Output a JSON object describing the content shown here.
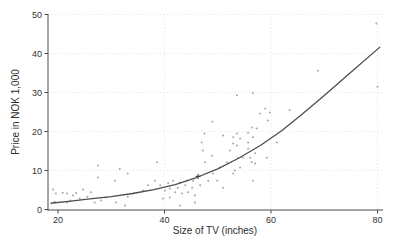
{
  "chart_data": {
    "type": "scatter",
    "title": "",
    "xlabel": "Size of TV (inches)",
    "ylabel": "Price in NOK 1,000",
    "xlim": [
      18,
      81
    ],
    "ylim": [
      0,
      50
    ],
    "x_ticks": [
      20,
      40,
      60,
      80
    ],
    "x_grid_ticks": [
      40,
      60,
      80
    ],
    "y_ticks": [
      0,
      10,
      20,
      30,
      40,
      50
    ],
    "grid": "dotted",
    "legend": "none",
    "colors": {
      "scatter": "#a6a6a6",
      "line": "#4d4d4d",
      "axis": "#4a4a4a",
      "grid": "#dcdcdc",
      "mean_marker": "#333333",
      "text": "#333333"
    },
    "points": [
      [
        19.1,
        5.1
      ],
      [
        19.4,
        2.0
      ],
      [
        19.6,
        4.1
      ],
      [
        20.9,
        4.3
      ],
      [
        21.7,
        4.1
      ],
      [
        21.7,
        1.8
      ],
      [
        22.3,
        2.3
      ],
      [
        22.8,
        3.6
      ],
      [
        23.4,
        4.2
      ],
      [
        24.1,
        2.8
      ],
      [
        24.7,
        5.1
      ],
      [
        25.5,
        3.3
      ],
      [
        26.2,
        4.4
      ],
      [
        26.9,
        1.8
      ],
      [
        27.5,
        8.2
      ],
      [
        27.5,
        11.3
      ],
      [
        28.1,
        2.3
      ],
      [
        29.0,
        3.1
      ],
      [
        30.7,
        7.4
      ],
      [
        30.9,
        1.8
      ],
      [
        31.6,
        10.4
      ],
      [
        32.6,
        1.0
      ],
      [
        33.1,
        3.3
      ],
      [
        33.1,
        9.2
      ],
      [
        34.1,
        4.1
      ],
      [
        36.0,
        4.9
      ],
      [
        36.9,
        6.2
      ],
      [
        38.2,
        7.4
      ],
      [
        38.6,
        12.1
      ],
      [
        39.2,
        6.2
      ],
      [
        39.7,
        2.8
      ],
      [
        40.1,
        4.9
      ],
      [
        40.7,
        6.7
      ],
      [
        41.0,
        3.1
      ],
      [
        41.0,
        5.4
      ],
      [
        41.6,
        7.4
      ],
      [
        42.0,
        4.4
      ],
      [
        42.5,
        5.6
      ],
      [
        42.9,
        1.0
      ],
      [
        42.9,
        6.9
      ],
      [
        43.3,
        4.1
      ],
      [
        43.9,
        6.2
      ],
      [
        44.2,
        7.4
      ],
      [
        44.4,
        4.4
      ],
      [
        45.2,
        5.6
      ],
      [
        45.4,
        7.4
      ],
      [
        45.7,
        1.8
      ],
      [
        45.7,
        3.6
      ],
      [
        46.7,
        6.2
      ],
      [
        47.0,
        17.2
      ],
      [
        47.2,
        15.1
      ],
      [
        47.5,
        19.5
      ],
      [
        47.6,
        12.1
      ],
      [
        48.2,
        7.4
      ],
      [
        48.9,
        13.8
      ],
      [
        49.0,
        22.5
      ],
      [
        49.1,
        9.2
      ],
      [
        49.9,
        7.4
      ],
      [
        50.4,
        10.8
      ],
      [
        51.0,
        5.6
      ],
      [
        51.0,
        19.0
      ],
      [
        51.7,
        12.1
      ],
      [
        52.3,
        15.1
      ],
      [
        52.9,
        9.2
      ],
      [
        52.9,
        16.9
      ],
      [
        52.9,
        18.5
      ],
      [
        53.2,
        10.0
      ],
      [
        53.6,
        16.4
      ],
      [
        53.6,
        19.5
      ],
      [
        53.6,
        29.3
      ],
      [
        53.8,
        13.3
      ],
      [
        54.2,
        10.8
      ],
      [
        54.2,
        18.2
      ],
      [
        54.7,
        13.3
      ],
      [
        55.7,
        15.6
      ],
      [
        55.7,
        17.2
      ],
      [
        55.7,
        19.7
      ],
      [
        56.1,
        13.3
      ],
      [
        56.4,
        12.1
      ],
      [
        56.4,
        21.0
      ],
      [
        56.6,
        7.4
      ],
      [
        56.6,
        18.5
      ],
      [
        56.6,
        29.9
      ],
      [
        57.0,
        11.8
      ],
      [
        57.0,
        14.4
      ],
      [
        57.3,
        20.8
      ],
      [
        57.9,
        24.6
      ],
      [
        58.9,
        25.9
      ],
      [
        59.2,
        13.3
      ],
      [
        59.4,
        22.8
      ],
      [
        59.8,
        24.9
      ],
      [
        61.1,
        17.2
      ],
      [
        63.5,
        25.5
      ],
      [
        68.8,
        35.6
      ],
      [
        79.8,
        47.7
      ],
      [
        80.0,
        31.5
      ]
    ],
    "trend_line": [
      [
        18.6,
        1.6
      ],
      [
        22,
        2.1
      ],
      [
        26,
        2.7
      ],
      [
        30,
        3.3
      ],
      [
        34,
        4.1
      ],
      [
        38,
        5.1
      ],
      [
        42,
        6.4
      ],
      [
        46,
        8.2
      ],
      [
        50,
        10.4
      ],
      [
        54,
        13.2
      ],
      [
        58,
        16.4
      ],
      [
        62,
        20.2
      ],
      [
        66,
        24.6
      ],
      [
        70,
        29.2
      ],
      [
        75,
        35.2
      ],
      [
        80.5,
        41.7
      ]
    ],
    "mean_marker": {
      "x": 46.3,
      "y": 8.5
    }
  }
}
